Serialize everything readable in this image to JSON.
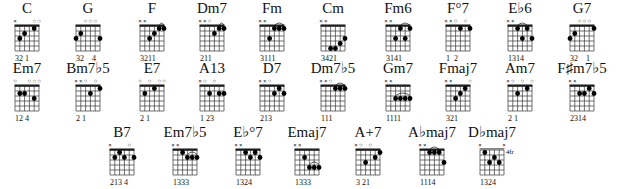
{
  "chords": [
    {
      "name": "C",
      "strings": [
        "x",
        "",
        "",
        "",
        "o",
        "o"
      ],
      "frets": [
        null,
        3,
        2,
        null,
        1,
        null
      ],
      "fingers": "32 1",
      "barre": null,
      "position": null
    },
    {
      "name": "G",
      "strings": [
        "",
        "",
        "o",
        "o",
        "o",
        ""
      ],
      "frets": [
        3,
        2,
        null,
        null,
        null,
        3
      ],
      "fingers": "32    4",
      "barre": null,
      "position": null
    },
    {
      "name": "F",
      "strings": [
        "x",
        "x",
        "",
        "",
        "",
        ""
      ],
      "frets": [
        null,
        null,
        3,
        2,
        1,
        1
      ],
      "fingers": "3211",
      "barre": {
        "fret": 1,
        "from": 4,
        "to": 5
      },
      "position": null
    },
    {
      "name": "Dm7",
      "strings": [
        "x",
        "x",
        "o",
        "",
        "",
        ""
      ],
      "frets": [
        null,
        null,
        null,
        2,
        1,
        1
      ],
      "fingers": "211",
      "barre": {
        "fret": 1,
        "from": 4,
        "to": 5
      },
      "position": null
    },
    {
      "name": "Fm",
      "strings": [
        "x",
        "x",
        "",
        "",
        "",
        ""
      ],
      "frets": [
        null,
        null,
        3,
        1,
        1,
        1
      ],
      "fingers": "3111",
      "barre": {
        "fret": 1,
        "from": 3,
        "to": 5
      },
      "position": null
    },
    {
      "name": "Cm",
      "strings": [
        "x",
        "x",
        "",
        "",
        "",
        ""
      ],
      "frets": [
        null,
        null,
        5,
        5,
        4,
        3
      ],
      "fingers": "3421",
      "barre": null,
      "position": null
    },
    {
      "name": "Fm6",
      "strings": [
        "x",
        "x",
        "",
        "",
        "",
        ""
      ],
      "frets": [
        null,
        null,
        3,
        1,
        3,
        1
      ],
      "fingers": "3141",
      "barre": {
        "fret": 1,
        "from": 3,
        "to": 5
      },
      "position": null
    },
    {
      "name": "F°7",
      "strings": [
        "x",
        "x",
        "o",
        "",
        "o",
        ""
      ],
      "frets": [
        null,
        null,
        null,
        1,
        null,
        1
      ],
      "fingers": "1  2",
      "barre": null,
      "position": null
    },
    {
      "name": "E♭6",
      "strings": [
        "x",
        "x",
        "",
        "",
        "",
        ""
      ],
      "frets": [
        null,
        null,
        1,
        3,
        1,
        3
      ],
      "fingers": "1314",
      "barre": {
        "fret": 1,
        "from": 2,
        "to": 4
      },
      "position": null
    },
    {
      "name": "G7",
      "strings": [
        "",
        "",
        "o",
        "o",
        "o",
        ""
      ],
      "frets": [
        3,
        2,
        null,
        null,
        null,
        1
      ],
      "fingers": "32    1",
      "barre": null,
      "position": null
    },
    {
      "name": "Em7",
      "strings": [
        "o",
        "",
        "",
        "o",
        "o",
        "o"
      ],
      "frets": [
        null,
        2,
        2,
        null,
        3,
        null
      ],
      "fingers": "12 4",
      "barre": null,
      "position": null
    },
    {
      "name": "Bm7♭5",
      "strings": [
        "x",
        "x",
        "o",
        "",
        "o",
        ""
      ],
      "frets": [
        null,
        null,
        null,
        2,
        null,
        1
      ],
      "fingers": "2 1",
      "barre": null,
      "position": null
    },
    {
      "name": "E7",
      "strings": [
        "o",
        "",
        "o",
        "",
        "o",
        "o"
      ],
      "frets": [
        null,
        2,
        null,
        1,
        null,
        null
      ],
      "fingers": "2 1",
      "barre": null,
      "position": null
    },
    {
      "name": "A13",
      "strings": [
        "x",
        "o",
        "",
        "o",
        "",
        ""
      ],
      "frets": [
        null,
        null,
        2,
        null,
        2,
        2
      ],
      "fingers": "1 23",
      "barre": null,
      "position": null
    },
    {
      "name": "D7",
      "strings": [
        "x",
        "x",
        "o",
        "",
        "",
        ""
      ],
      "frets": [
        null,
        null,
        null,
        2,
        1,
        2
      ],
      "fingers": "213",
      "barre": null,
      "position": null
    },
    {
      "name": "Dm7♭5",
      "strings": [
        "x",
        "x",
        "o",
        "",
        "",
        ""
      ],
      "frets": [
        null,
        null,
        null,
        1,
        1,
        1
      ],
      "fingers": "111",
      "barre": {
        "fret": 1,
        "from": 3,
        "to": 5
      },
      "position": null
    },
    {
      "name": "Gm7",
      "strings": [
        "x",
        "x",
        "",
        "",
        "",
        ""
      ],
      "frets": [
        null,
        null,
        3,
        3,
        3,
        3
      ],
      "fingers": "1111",
      "barre": {
        "fret": 3,
        "from": 2,
        "to": 5
      },
      "position": null
    },
    {
      "name": "Fmaj7",
      "strings": [
        "x",
        "x",
        "",
        "",
        "",
        "o"
      ],
      "frets": [
        null,
        null,
        3,
        2,
        1,
        null
      ],
      "fingers": "321",
      "barre": null,
      "position": null
    },
    {
      "name": "Am7",
      "strings": [
        "x",
        "o",
        "",
        "o",
        "",
        "o"
      ],
      "frets": [
        null,
        null,
        2,
        null,
        1,
        null
      ],
      "fingers": "2 1",
      "barre": null,
      "position": null
    },
    {
      "name": "F♯m7♭5",
      "strings": [
        "x",
        "x",
        "",
        "",
        "",
        ""
      ],
      "frets": [
        null,
        null,
        2,
        2,
        1,
        2
      ],
      "fingers": "2314",
      "barre": null,
      "position": null
    },
    {
      "name": "B7",
      "strings": [
        "x",
        "",
        "",
        "",
        "o",
        ""
      ],
      "frets": [
        null,
        2,
        1,
        2,
        null,
        2
      ],
      "fingers": "213 4",
      "barre": null,
      "position": null
    },
    {
      "name": "Em7♭5",
      "strings": [
        "x",
        "x",
        "",
        "",
        "",
        ""
      ],
      "frets": [
        null,
        null,
        1,
        2,
        2,
        2
      ],
      "fingers": "1333",
      "barre": {
        "fret": 2,
        "from": 3,
        "to": 5
      },
      "position": null
    },
    {
      "name": "E♭°7",
      "strings": [
        "x",
        "x",
        "",
        "",
        "",
        ""
      ],
      "frets": [
        null,
        null,
        1,
        2,
        1,
        2
      ],
      "fingers": "1324",
      "barre": null,
      "position": null
    },
    {
      "name": "Emaj7",
      "strings": [
        "x",
        "x",
        "",
        "",
        "",
        ""
      ],
      "frets": [
        null,
        null,
        2,
        4,
        4,
        4
      ],
      "fingers": "1333",
      "barre": {
        "fret": 4,
        "from": 3,
        "to": 5
      },
      "position": null
    },
    {
      "name": "A+7",
      "strings": [
        "x",
        "o",
        "",
        "o",
        "",
        ""
      ],
      "frets": [
        null,
        null,
        3,
        null,
        2,
        1
      ],
      "fingers": "3 21",
      "barre": null,
      "position": null
    },
    {
      "name": "A♭maj7",
      "strings": [
        "x",
        "x",
        "",
        "",
        "",
        ""
      ],
      "frets": [
        null,
        null,
        1,
        1,
        1,
        3
      ],
      "fingers": "1114",
      "barre": {
        "fret": 1,
        "from": 2,
        "to": 4
      },
      "position": null
    },
    {
      "name": "D♭maj7",
      "strings": [
        "x",
        "",
        "",
        "",
        "",
        "x"
      ],
      "frets": [
        null,
        1,
        3,
        2,
        3,
        null
      ],
      "fingers": "1324",
      "barre": null,
      "position": "4fr"
    }
  ]
}
